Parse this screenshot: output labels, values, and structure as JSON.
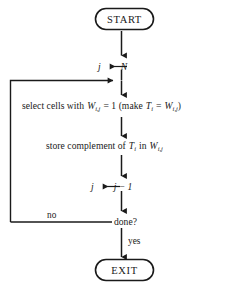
{
  "diagram": {
    "background_color": "#ffffff",
    "line_color": "#1a1a1a",
    "nodes": {
      "start": {
        "label": "START",
        "shape": "stadium"
      },
      "init": {
        "text_plain": "j ← N",
        "var_left": "j",
        "arrow": "←",
        "var_right": "N"
      },
      "select": {
        "text_plain": "select cells with W(i,j) = 1 (make T(i) = W(i,j))",
        "prefix": "select cells with",
        "w_var": "W",
        "w_sub": "i,j",
        "eq_one": "= 1 (make",
        "t_var": "T",
        "t_sub": "i",
        "eq_mid": "=",
        "w2_var": "W",
        "w2_sub": "i,j",
        "suffix": ")"
      },
      "store": {
        "text_plain": "store complement of T(i) in W(i,j)",
        "prefix": "store complement of",
        "t_var": "T",
        "t_sub": "i",
        "mid": "in",
        "w_var": "W",
        "w_sub": "i,j"
      },
      "decrement": {
        "text_plain": "j ← j − 1",
        "var_left": "j",
        "arrow": "←",
        "expr": "j − 1"
      },
      "decision": {
        "label": "done?"
      },
      "exit": {
        "label": "EXIT",
        "shape": "stadium"
      }
    },
    "edges": {
      "no_label": "no",
      "yes_label": "yes"
    }
  }
}
